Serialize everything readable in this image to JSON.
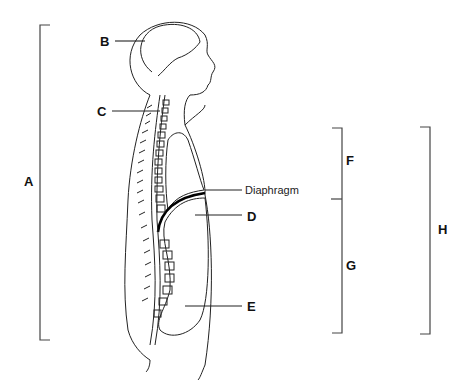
{
  "labels": {
    "A": "A",
    "B": "B",
    "C": "C",
    "D": "D",
    "E": "E",
    "F": "F",
    "G": "G",
    "H": "H",
    "diaphragm": "Diaphragm"
  }
}
